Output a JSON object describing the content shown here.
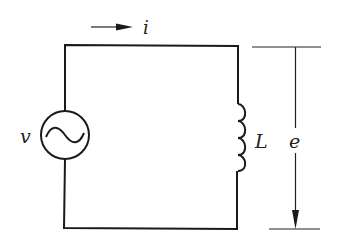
{
  "diagram": {
    "type": "circuit",
    "components": [
      {
        "id": "source",
        "kind": "ac-voltage-source",
        "label": "v"
      },
      {
        "id": "inductor",
        "kind": "inductor",
        "label": "L"
      }
    ],
    "annotations": {
      "current_label": "i",
      "current_direction": "right",
      "voltage_label": "e",
      "voltage_direction": "down"
    },
    "colors": {
      "line": "#1a1a1a",
      "background": "#ffffff"
    }
  }
}
